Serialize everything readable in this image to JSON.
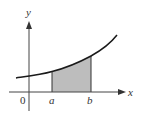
{
  "diagram": {
    "labels": {
      "y_axis": "y",
      "x_axis": "x",
      "origin": "0",
      "a": "a",
      "b": "b"
    },
    "colors": {
      "axis": "#333333",
      "curve": "#1a1a1a",
      "shade": "#bdbdbd",
      "text": "#333333",
      "background": "#ffffff"
    },
    "shaded_region": "area under curve from x=a to x=b"
  }
}
